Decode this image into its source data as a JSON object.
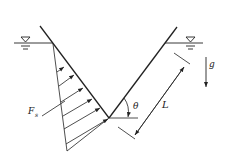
{
  "diagram": {
    "type": "hydrostatic-v-channel",
    "labels": {
      "force": "F",
      "force_subscript": "s",
      "angle": "θ",
      "length": "L",
      "gravity": "g"
    },
    "colors": {
      "line": "#222222",
      "background": "#ffffff"
    },
    "water_surface_symbols": 2,
    "pressure_arrows": 6
  }
}
